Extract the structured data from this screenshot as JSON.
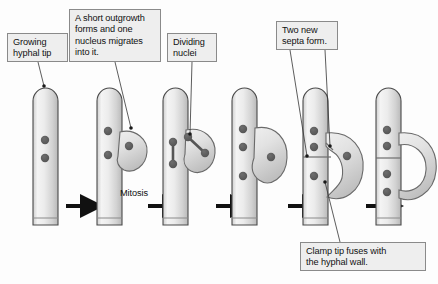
{
  "figure": {
    "type": "biology-process-diagram",
    "stage_count": 6,
    "background_color": "#ffffff",
    "hypha_fill_colors": [
      "#f2f2f2",
      "#d4d4d4",
      "#bdbdbd"
    ],
    "hypha_outline_color": "#4a4a4a",
    "nucleus_color": "#595959",
    "septum_color": "#777777",
    "arrow_color": "#111111"
  },
  "callouts": {
    "growing_tip": "Growing\nhyphal tip",
    "outgrowth": "A short outgrowth\nforms and one\nnucleus migrates\ninto it.",
    "dividing_nuclei": "Dividing\nnuclei",
    "two_septa": "Two new\nsepta form.",
    "clamp_fuses": "Clamp tip fuses with\nthe hyphal wall."
  },
  "stage_labels": {
    "mitosis": "Mitosis"
  },
  "stages": [
    {
      "index": 1,
      "name": "growing-hyphal-tip",
      "nuclei": 2,
      "clamp": "none",
      "septa": 1
    },
    {
      "index": 2,
      "name": "short-outgrowth-forms",
      "nuclei": 3,
      "clamp": "short-hook",
      "septa": 1
    },
    {
      "index": 3,
      "name": "dividing-nuclei",
      "nuclei": 2,
      "nuclei_dividing": 2,
      "clamp": "hook",
      "septa": 1
    },
    {
      "index": 4,
      "name": "nuclei-separated",
      "nuclei": 4,
      "clamp": "long-hook",
      "septa": 1
    },
    {
      "index": 5,
      "name": "two-new-septa-form",
      "nuclei": 4,
      "clamp": "curved-to-wall",
      "septa": 3
    },
    {
      "index": 6,
      "name": "clamp-tip-fused",
      "nuclei": 4,
      "clamp": "fused-loop",
      "septa": 3
    }
  ],
  "arrows": {
    "count": 5,
    "direction": "right"
  }
}
